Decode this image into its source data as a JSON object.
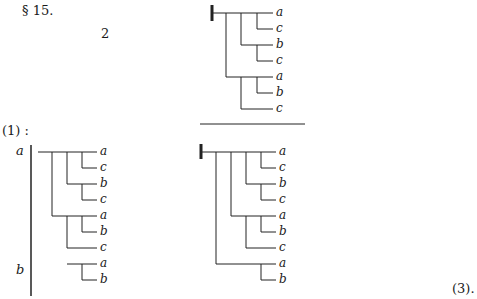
{
  "header": {
    "section": "§ 15.",
    "number": "2"
  },
  "labels": {
    "eq1": "(1) :",
    "eq3": "(3).",
    "left_a": "a",
    "left_b": "b"
  },
  "trees": {
    "top": {
      "leaves": [
        "a",
        "c",
        "b",
        "c",
        "a",
        "b",
        "c"
      ]
    },
    "left": {
      "leaves": [
        "a",
        "c",
        "b",
        "c",
        "a",
        "b",
        "c",
        "a",
        "b"
      ]
    },
    "right": {
      "leaves": [
        "a",
        "c",
        "b",
        "c",
        "a",
        "b",
        "c",
        "a",
        "b"
      ]
    }
  }
}
